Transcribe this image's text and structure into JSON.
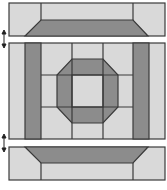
{
  "diagram": {
    "colors": {
      "light": "#d9d9d9",
      "dark": "#8c8c8c",
      "stroke": "#3a3a3a",
      "background": "#ffffff"
    },
    "parts": [
      {
        "id": "top-strip",
        "label": "Top border strip"
      },
      {
        "id": "center-block",
        "label": "Center octagon block"
      },
      {
        "id": "bottom-strip",
        "label": "Bottom border strip"
      }
    ],
    "connectors": [
      {
        "id": "top-arrow",
        "icon": "double-arrow-vertical"
      },
      {
        "id": "bottom-arrow",
        "icon": "double-arrow-vertical"
      }
    ]
  }
}
